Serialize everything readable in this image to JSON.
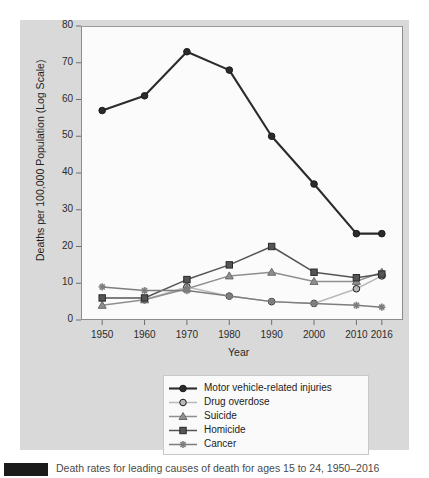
{
  "figure": {
    "background_color": "#ffffff",
    "panel_color": "#d9d9d9",
    "plot_color": "#fbfbfb"
  },
  "axes": {
    "xlabel": "Year",
    "ylabel": "Deaths per 100,000 Population (Log Scale)",
    "xticks": [
      "1950",
      "1960",
      "1970",
      "1980",
      "1990",
      "2000",
      "2010",
      "2016"
    ],
    "yticks": [
      "0",
      "10",
      "20",
      "30",
      "40",
      "50",
      "60",
      "70",
      "80"
    ]
  },
  "legend": {
    "items": [
      {
        "label": "Motor vehicle-related injuries",
        "color": "#2b2b2b",
        "marker": "circle"
      },
      {
        "label": "Drug overdose",
        "color": "#b9b9b9",
        "marker": "circle"
      },
      {
        "label": "Suicide",
        "color": "#8f8f8f",
        "marker": "triangle"
      },
      {
        "label": "Homicide",
        "color": "#555555",
        "marker": "square"
      },
      {
        "label": "Cancer",
        "color": "#7d7d7d",
        "marker": "asterisk"
      }
    ]
  },
  "caption": {
    "badge_label": "",
    "text": "Death rates for leading causes of death for ages 15 to 24, 1950–2016"
  },
  "chart_data": {
    "type": "line",
    "title": "",
    "subtitle": "",
    "xlabel": "Year",
    "ylabel": "Deaths per 100,000 Population (Log Scale)",
    "x": [
      1950,
      1960,
      1970,
      1980,
      1990,
      2000,
      2010,
      2016
    ],
    "categories": [
      "1950",
      "1960",
      "1970",
      "1980",
      "1990",
      "2000",
      "2010",
      "2016"
    ],
    "xlim": [
      1945,
      2021
    ],
    "ylim": [
      0,
      80
    ],
    "grid": false,
    "legend_position": "below-plot",
    "series": [
      {
        "name": "Motor vehicle-related injuries",
        "color": "#2b2b2b",
        "marker": "circle",
        "values": [
          57,
          61,
          73,
          68,
          50,
          37,
          23.5,
          23.5
        ]
      },
      {
        "name": "Drug overdose",
        "color": "#b9b9b9",
        "marker": "circle",
        "values": [
          null,
          5.5,
          9,
          6.5,
          5,
          4.5,
          8.5,
          12
        ]
      },
      {
        "name": "Suicide",
        "color": "#8f8f8f",
        "marker": "triangle",
        "values": [
          4,
          5.5,
          8.5,
          12,
          13,
          10.5,
          10.5,
          13
        ]
      },
      {
        "name": "Homicide",
        "color": "#555555",
        "marker": "square",
        "values": [
          6,
          6,
          11,
          15,
          20,
          13,
          11.5,
          12.5
        ]
      },
      {
        "name": "Cancer",
        "color": "#7d7d7d",
        "marker": "asterisk",
        "values": [
          9,
          8,
          8,
          6.5,
          5,
          4.5,
          4,
          3.5
        ]
      }
    ]
  }
}
